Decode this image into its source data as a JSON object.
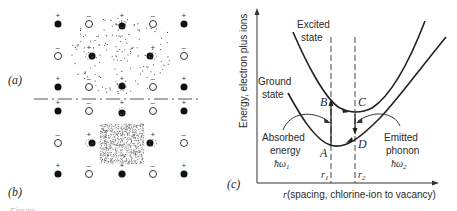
{
  "figure": {
    "panel_labels": {
      "a": "(a)",
      "b": "(b)",
      "c": "(c)"
    },
    "caption_partial": "Figure"
  },
  "lattice": {
    "columns_x": [
      58,
      89,
      122,
      153,
      184
    ],
    "rows": [
      {
        "y": 24,
        "ions": [
          "+",
          "-",
          "+",
          "-",
          "+"
        ]
      },
      {
        "y": 56,
        "ions": [
          "-",
          "+",
          "",
          "+",
          "-"
        ]
      },
      {
        "y": 87,
        "ions": [
          "+",
          "-",
          "+",
          "-",
          "+"
        ]
      },
      {
        "y": 111,
        "ions": [
          "+",
          "-",
          "+",
          "-",
          "+"
        ]
      },
      {
        "y": 143,
        "ions": [
          "-",
          "+",
          "",
          "+",
          "-"
        ]
      },
      {
        "y": 174,
        "ions": [
          "+",
          "-",
          "+",
          "-",
          "+"
        ]
      }
    ],
    "legend": {
      "positive": "filled circle (+ ion)",
      "negative": "open circle (− ion)"
    }
  },
  "chart_data": {
    "type": "line",
    "title": "",
    "xlabel": "r (spacing, chlorine-ion to vacancy)",
    "ylabel": "Energy, electron plus ions",
    "series": [
      {
        "name": "Excited state",
        "shape": "parabola",
        "minimum_near": "r2"
      },
      {
        "name": "Ground state",
        "shape": "parabola",
        "minimum_near": "r1"
      }
    ],
    "markers": {
      "r1": "r1",
      "r2": "r2"
    },
    "points": {
      "A": "ground min at r1",
      "B": "excited at r1",
      "C": "excited min at r2",
      "D": "ground at r2"
    },
    "annotations": [
      {
        "text": "Excited state"
      },
      {
        "text": "Ground state"
      },
      {
        "text": "Absorbed energy",
        "sub": "ħω₁"
      },
      {
        "text": "Emitted phonon",
        "sub": "ħω₂"
      }
    ]
  },
  "chart": {
    "y_axis_label": "Energy, electron plus ions",
    "x_axis_label": "r (spacing, chlorine-ion to vacancy)",
    "excited_label_1": "Excited",
    "excited_label_2": "state",
    "ground_label_1": "Ground",
    "ground_label_2": "state",
    "absorbed_1": "Absorbed",
    "absorbed_2": "energy",
    "absorbed_3": "ħω",
    "absorbed_sub": "1",
    "emitted_1": "Emitted",
    "emitted_2": "phonon",
    "emitted_3": "ħω",
    "emitted_sub": "2",
    "point_A": "A",
    "point_B": "B",
    "point_C": "C",
    "point_D": "D",
    "r1": "r",
    "r1_sub": "1",
    "r2": "r",
    "r2_sub": "2",
    "x_r": "r",
    "x_rest": "(spacing, chlorine-ion to vacancy)"
  }
}
